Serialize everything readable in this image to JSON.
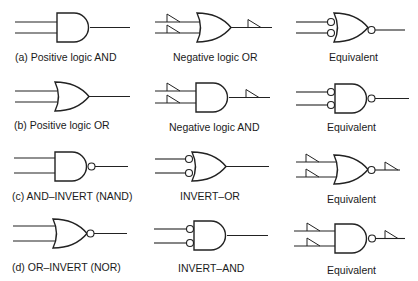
{
  "figure": {
    "rows": [
      {
        "id": "a",
        "cells": [
          {
            "label": "(a) Positive logic AND",
            "gate": "AND",
            "input_bubbles": false,
            "output_bubble": false,
            "polarity_indicators": false
          },
          {
            "label": "Negative logic OR",
            "gate": "OR",
            "input_bubbles": false,
            "output_bubble": false,
            "polarity_indicators": true
          },
          {
            "label": "Equivalent",
            "gate": "OR",
            "input_bubbles": true,
            "output_bubble": true,
            "polarity_indicators": false
          }
        ]
      },
      {
        "id": "b",
        "cells": [
          {
            "label": "(b) Positive logic OR",
            "gate": "OR",
            "input_bubbles": false,
            "output_bubble": false,
            "polarity_indicators": false
          },
          {
            "label": "Negative logic AND",
            "gate": "AND",
            "input_bubbles": false,
            "output_bubble": false,
            "polarity_indicators": true
          },
          {
            "label": "Equivalent",
            "gate": "AND",
            "input_bubbles": true,
            "output_bubble": true,
            "polarity_indicators": false
          }
        ]
      },
      {
        "id": "c",
        "cells": [
          {
            "label": "(c) AND–INVERT (NAND)",
            "gate": "AND",
            "input_bubbles": false,
            "output_bubble": true,
            "polarity_indicators": false
          },
          {
            "label": "INVERT–OR",
            "gate": "OR",
            "input_bubbles": true,
            "output_bubble": false,
            "polarity_indicators": false
          },
          {
            "label": "Equivalent",
            "gate": "OR",
            "input_bubbles": false,
            "output_bubble": true,
            "polarity_indicators": true
          }
        ]
      },
      {
        "id": "d",
        "cells": [
          {
            "label": "(d) OR–INVERT (NOR)",
            "gate": "OR",
            "input_bubbles": false,
            "output_bubble": true,
            "polarity_indicators": false
          },
          {
            "label": "INVERT–AND",
            "gate": "AND",
            "input_bubbles": true,
            "output_bubble": false,
            "polarity_indicators": false
          },
          {
            "label": "Equivalent",
            "gate": "AND",
            "input_bubbles": false,
            "output_bubble": true,
            "polarity_indicators": true
          }
        ]
      }
    ]
  }
}
